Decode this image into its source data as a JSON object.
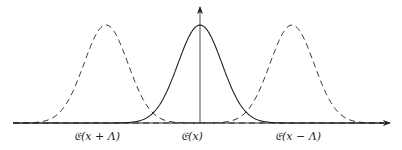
{
  "diagram": {
    "type": "shifted-gaussian-curves",
    "colors": {
      "stroke": "#222222",
      "background": "#ffffff"
    },
    "axes": {
      "x_axis": {
        "from": [
          13,
          123
        ],
        "to": [
          390,
          123
        ],
        "arrow": true
      },
      "y_axis": {
        "from": [
          200,
          123
        ],
        "to": [
          200,
          7
        ],
        "arrow": true
      }
    },
    "curves": [
      {
        "id": "left-shifted",
        "style": "dashed",
        "center_x": 106,
        "label": "𝔈(x + Λ)",
        "label_x": 97
      },
      {
        "id": "center",
        "style": "solid",
        "center_x": 200,
        "label": "𝔈(x)",
        "label_x": 192
      },
      {
        "id": "right-shifted",
        "style": "dashed",
        "center_x": 292,
        "label": "𝔈(x − Λ)",
        "label_x": 298
      }
    ],
    "peak_y": 25,
    "baseline_y": 123,
    "sigma_px": 22,
    "label_y": 130
  }
}
